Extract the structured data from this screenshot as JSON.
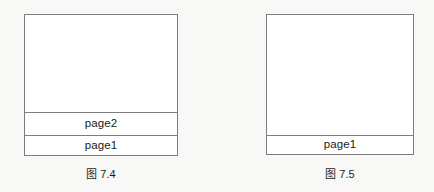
{
  "figures": [
    {
      "id": "figure-7-4",
      "caption": "图 7.4",
      "frames": [
        {
          "label": "",
          "kind": "empty-space"
        },
        {
          "label": "page2",
          "kind": "stack-frame"
        },
        {
          "label": "page1",
          "kind": "stack-frame"
        }
      ]
    },
    {
      "id": "figure-7-5",
      "caption": "图 7.5",
      "frames": [
        {
          "label": "",
          "kind": "empty-space"
        },
        {
          "label": "page1",
          "kind": "stack-frame"
        }
      ]
    }
  ],
  "style": {
    "border_color": "#7d7d7d",
    "box_fill": "#ffffff",
    "page_background": "#f8f8f7",
    "text_color": "#1a1a1a"
  }
}
